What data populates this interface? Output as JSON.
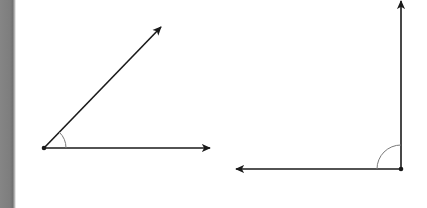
{
  "figure": {
    "colors": {
      "stroke": "#1a1a1a",
      "arc": "#7a7a7a",
      "page_edge": "#7e7e7e",
      "background": "#ffffff"
    },
    "angles": [
      {
        "id": "acute-angle",
        "type": "acute",
        "vertex": [
          44,
          148
        ],
        "rays": [
          {
            "id": "horizontal-ray",
            "end": [
              210,
              148
            ]
          },
          {
            "id": "diagonal-ray",
            "end": [
              161,
              27
            ]
          }
        ],
        "arc_radius": 22
      },
      {
        "id": "right-angle",
        "type": "right",
        "vertex": [
          401,
          169
        ],
        "rays": [
          {
            "id": "vertical-ray",
            "end": [
              401,
              1
            ]
          },
          {
            "id": "leftward-ray",
            "end": [
              236,
              169
            ]
          }
        ],
        "arc_radius": 24
      }
    ]
  }
}
